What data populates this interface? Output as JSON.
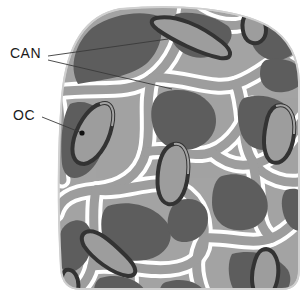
{
  "figure": {
    "type": "histology-diagram",
    "background_color": "#ffffff",
    "specimen_shape": "rounded-dome-block",
    "colors": {
      "matrix_dark": "#5d5d5d",
      "lamellar_light": "#9d9d9d",
      "channel_white": "#ffffff",
      "lacuna_dark": "#333333",
      "outline_gray": "#b8b8b8",
      "label_text": "#1a1a1a",
      "leader_line": "#3a3a3a"
    }
  },
  "labels": [
    {
      "id": "can",
      "text": "CAN",
      "meaning": "canaliculi",
      "x": 10,
      "y": 45,
      "leader_count": 2
    },
    {
      "id": "oc",
      "text": "OC",
      "meaning": "osteocyte",
      "x": 13,
      "y": 107,
      "leader_count": 1,
      "has_endpoint_dot": true
    }
  ],
  "leaders": {
    "can_line_1": {
      "x1": 48,
      "y1": 56,
      "x2": 168,
      "y2": 39
    },
    "can_line_2": {
      "x1": 48,
      "y1": 60,
      "x2": 172,
      "y2": 89
    },
    "oc_line_1": {
      "x1": 42,
      "y1": 117,
      "x2": 82,
      "y2": 133
    },
    "oc_dot": {
      "cx": 82,
      "cy": 133,
      "r": 2.6
    }
  }
}
